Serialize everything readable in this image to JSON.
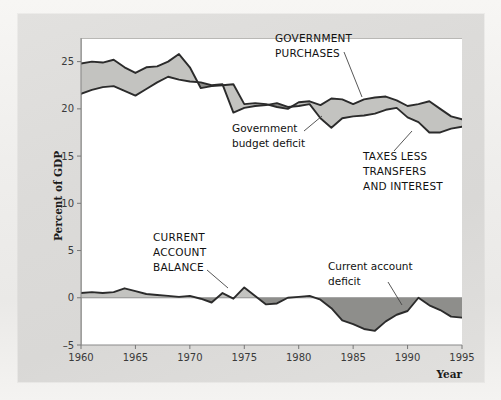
{
  "figure": {
    "background_color": "#dcdbd9",
    "plot_background_color": "#ffffff",
    "line_color": "#2b2b2b",
    "light_fill_color": "#c3c3c0",
    "dark_fill_color": "#8e8e8b"
  },
  "axes": {
    "ylabel": "Percent  of  GDP",
    "xlabel": "Year",
    "y_ticks": [
      "25",
      "20",
      "15",
      "10",
      "5",
      "0",
      "–5"
    ],
    "y_tick_values": [
      25,
      20,
      15,
      10,
      5,
      0,
      -5
    ],
    "x_ticks": [
      "1960",
      "1965",
      "1970",
      "1975",
      "1980",
      "1985",
      "1990",
      "1995"
    ],
    "x_tick_values": [
      1960,
      1965,
      1970,
      1975,
      1980,
      1985,
      1990,
      1995
    ],
    "xlim": [
      1960,
      1995
    ],
    "ylim": [
      -5,
      27.5
    ]
  },
  "annotations": [
    {
      "id": "government-purchases",
      "text_lines": [
        "GOVERNMENT",
        "PURCHASES"
      ],
      "style": "caps",
      "text_x": 275,
      "text_y": 42,
      "leader": [
        [
          344,
          52
        ],
        [
          362,
          97
        ]
      ]
    },
    {
      "id": "government-budget-deficit",
      "text_lines": [
        "Government",
        "budget deficit"
      ],
      "style": "lower",
      "text_x": 232,
      "text_y": 132,
      "leader": [
        [
          304,
          131
        ],
        [
          322,
          116
        ]
      ]
    },
    {
      "id": "taxes-less-transfers-and-interest",
      "text_lines": [
        "TAXES LESS",
        "TRANSFERS",
        "AND INTEREST"
      ],
      "style": "caps",
      "text_x": 363,
      "text_y": 160,
      "leader": [
        [
          394,
          151
        ],
        [
          412,
          131
        ]
      ]
    },
    {
      "id": "current-account-balance",
      "text_lines": [
        "CURRENT",
        "ACCOUNT",
        "BALANCE"
      ],
      "style": "caps",
      "text_x": 153,
      "text_y": 241,
      "leader": [
        [
          207,
          270
        ],
        [
          228,
          288
        ]
      ]
    },
    {
      "id": "current-account-deficit",
      "text_lines": [
        "Current account",
        "deficit"
      ],
      "style": "lower",
      "text_x": 328,
      "text_y": 270,
      "leader": [
        [
          388,
          282
        ],
        [
          402,
          305
        ]
      ]
    }
  ],
  "chart_data": {
    "type": "area",
    "title": "",
    "xlabel": "Year",
    "ylabel": "Percent of GDP",
    "xlim": [
      1960,
      1995
    ],
    "ylim": [
      -5,
      27.5
    ],
    "grid": false,
    "legend": "annotated-inline",
    "x": [
      1960,
      1961,
      1962,
      1963,
      1964,
      1965,
      1966,
      1967,
      1968,
      1969,
      1970,
      1971,
      1972,
      1973,
      1974,
      1975,
      1976,
      1977,
      1978,
      1979,
      1980,
      1981,
      1982,
      1983,
      1984,
      1985,
      1986,
      1987,
      1988,
      1989,
      1990,
      1991,
      1992,
      1993,
      1994,
      1995
    ],
    "series": [
      {
        "name": "GOVERNMENT PURCHASES",
        "values": [
          24.8,
          25.0,
          24.9,
          25.2,
          24.4,
          23.8,
          24.4,
          24.5,
          25.0,
          25.8,
          24.4,
          22.2,
          22.4,
          22.5,
          22.6,
          20.5,
          20.6,
          20.5,
          20.2,
          20.0,
          20.7,
          20.8,
          20.4,
          21.1,
          21.0,
          20.5,
          21.0,
          21.2,
          21.3,
          20.9,
          20.3,
          20.5,
          20.8,
          20.0,
          19.2,
          18.9
        ]
      },
      {
        "name": "TAXES LESS TRANSFERS AND INTEREST",
        "values": [
          21.6,
          22.0,
          22.3,
          22.4,
          21.9,
          21.4,
          22.1,
          22.8,
          23.4,
          23.1,
          22.9,
          22.8,
          22.5,
          22.6,
          19.6,
          20.1,
          20.3,
          20.4,
          20.6,
          20.2,
          20.3,
          20.5,
          19.0,
          18.0,
          19.0,
          19.2,
          19.3,
          19.5,
          19.9,
          20.1,
          19.1,
          18.6,
          17.5,
          17.5,
          17.9,
          18.1
        ]
      },
      {
        "name": "CURRENT ACCOUNT BALANCE",
        "values": [
          0.5,
          0.6,
          0.5,
          0.6,
          1.0,
          0.7,
          0.4,
          0.3,
          0.2,
          0.1,
          0.2,
          -0.1,
          -0.5,
          0.5,
          -0.1,
          1.1,
          0.2,
          -0.7,
          -0.6,
          0.0,
          0.1,
          0.2,
          -0.2,
          -1.1,
          -2.4,
          -2.8,
          -3.3,
          -3.5,
          -2.5,
          -1.8,
          -1.4,
          0.0,
          -0.8,
          -1.3,
          -2.0,
          -2.1
        ]
      }
    ],
    "fills": [
      {
        "name": "Government budget deficit",
        "between": [
          "GOVERNMENT PURCHASES",
          "TAXES LESS TRANSFERS AND INTEREST"
        ],
        "light_color": "#c3c3c0",
        "dark_color": "#8e8e8b"
      },
      {
        "name": "Current account balance / deficit",
        "between": [
          "CURRENT ACCOUNT BALANCE",
          "zero"
        ],
        "light_color": "#c3c3c0",
        "dark_color": "#8e8e8b"
      }
    ]
  }
}
